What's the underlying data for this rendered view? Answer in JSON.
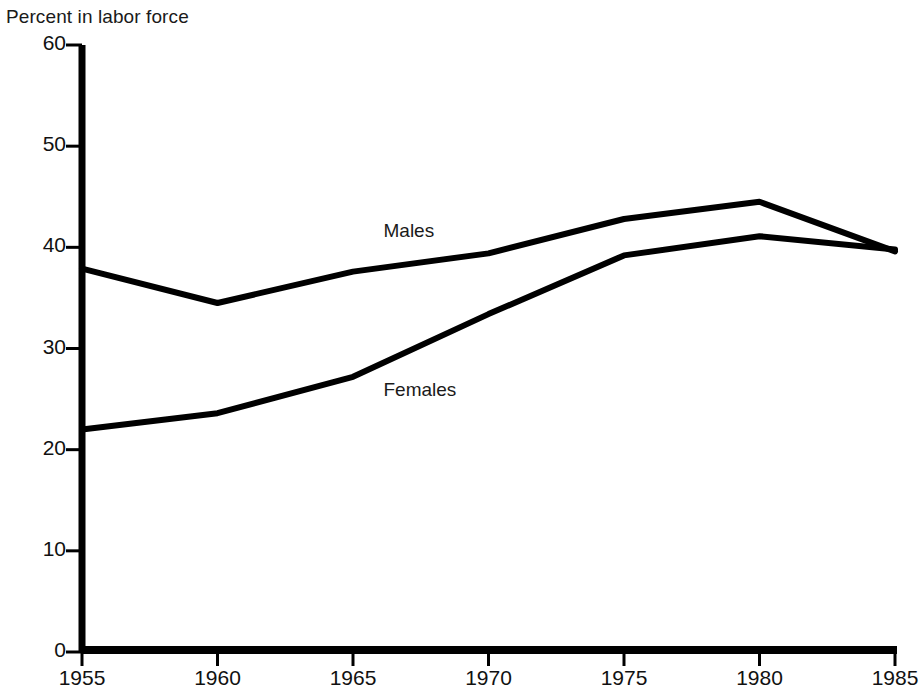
{
  "chart_data": {
    "type": "line",
    "title": "Percent in labor force",
    "xlabel": "",
    "ylabel": "Percent in labor force",
    "x": [
      1955,
      1960,
      1965,
      1970,
      1975,
      1980,
      1985
    ],
    "xlim": [
      1955,
      1985
    ],
    "ylim": [
      0,
      60
    ],
    "ytick_labels": [
      "0",
      "10",
      "20",
      "30",
      "40",
      "50",
      "60"
    ],
    "ytick_values": [
      0,
      10,
      20,
      30,
      40,
      50,
      60
    ],
    "xtick_labels": [
      "1955",
      "1960",
      "1965",
      "1970",
      "1975",
      "1980",
      "1985"
    ],
    "xtick_values": [
      1955,
      1960,
      1965,
      1970,
      1975,
      1980,
      1985
    ],
    "grid": false,
    "legend": "inline-labels",
    "line_color": "#000000",
    "background_color": "#ffffff",
    "series": [
      {
        "name": "Males",
        "label": "Males",
        "label_x": 1970,
        "label_y": 41.5,
        "values": [
          37.9,
          34.5,
          37.6,
          39.4,
          42.8,
          44.5,
          39.6
        ]
      },
      {
        "name": "Females",
        "label": "Females",
        "label_x": 1970,
        "label_y": 25.8,
        "values": [
          22.0,
          23.6,
          27.2,
          33.4,
          39.2,
          41.1,
          39.8
        ]
      }
    ]
  }
}
